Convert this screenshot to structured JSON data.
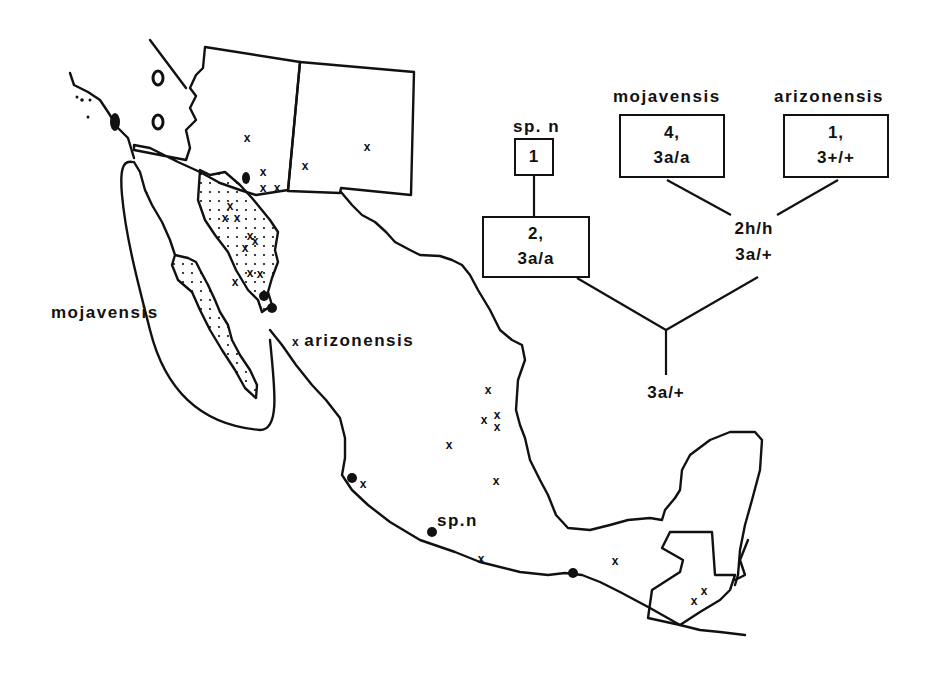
{
  "figure": {
    "type": "distribution-map-with-phylogeny",
    "map_labels": {
      "mojavensis": "mojavensis",
      "arizonensis": "arizonensis",
      "sp_n": "sp.n"
    },
    "legend_markers": {
      "cross": "x",
      "dot": "filled-circle",
      "stipple": "dotted-range"
    },
    "tree": {
      "tips": [
        {
          "taxon": "sp. n",
          "line1": "1",
          "line2": ""
        },
        {
          "taxon": "mojavensis",
          "line1": "4,",
          "line2": "3a/a"
        },
        {
          "taxon": "arizonensis",
          "line1": "1,",
          "line2": "3+/+"
        }
      ],
      "internal": [
        {
          "id": "spn-node",
          "line1": "2,",
          "line2": "3a/a"
        },
        {
          "id": "moj-ari-node",
          "line1": "2h/h",
          "line2": "3a/+"
        },
        {
          "id": "root",
          "line1": "3a/+"
        }
      ]
    },
    "colors": {
      "ink": "#111111",
      "background": "#ffffff"
    }
  }
}
